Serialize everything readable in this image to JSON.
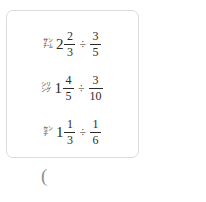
{
  "card": {
    "name": "math-choices-card",
    "choices": [
      {
        "marker": "㌠",
        "whole": "2",
        "left_numerator": "2",
        "left_denominator": "3",
        "operator": "÷",
        "right_numerator": "3",
        "right_denominator": "5"
      },
      {
        "marker": "㌡",
        "whole": "1",
        "left_numerator": "4",
        "left_denominator": "5",
        "operator": "÷",
        "right_numerator": "3",
        "right_denominator": "10"
      },
      {
        "marker": "㌢",
        "whole": "1",
        "left_numerator": "1",
        "left_denominator": "3",
        "operator": "÷",
        "right_numerator": "1",
        "right_denominator": "6"
      }
    ]
  },
  "answer": {
    "paren": "("
  },
  "colors": {
    "text": "#2b2b2b",
    "marker": "#5a5a5a",
    "border": "#dcdcdc",
    "paren": "#8f8f8f",
    "background": "#ffffff"
  }
}
